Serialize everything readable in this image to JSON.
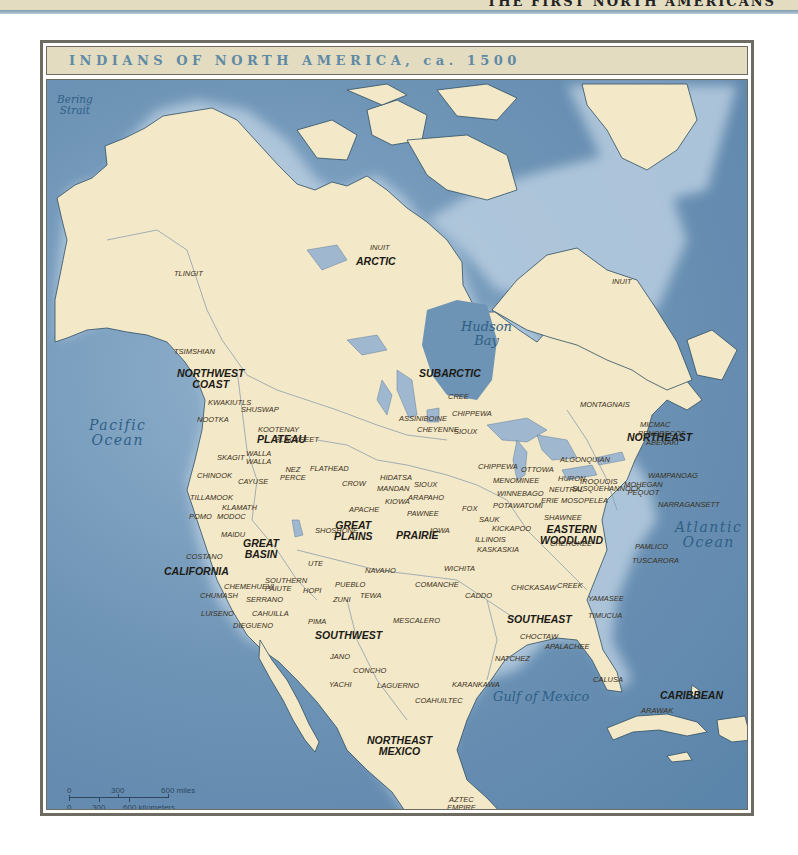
{
  "page": {
    "running_head": "THE FIRST NORTH AMERICANS"
  },
  "map": {
    "title": "INDIANS OF NORTH AMERICA, ca. 1500",
    "colors": {
      "ocean": "#6d93b5",
      "land": "#f3e8c8",
      "coast": "#2f4f63",
      "lake": "#9fb8d0",
      "title_bar": "#e4dcc0",
      "title_text": "#5f8aa6",
      "frame": "#6e6b62"
    },
    "water_bodies": [
      {
        "id": "bering-strait",
        "label": "Bering\nStrait"
      },
      {
        "id": "hudson-bay",
        "label": "Hudson\nBay"
      },
      {
        "id": "pacific-ocean",
        "label": "Pacific\nOcean"
      },
      {
        "id": "atlantic-ocean",
        "label": "Atlantic\nOcean"
      },
      {
        "id": "gulf-of-mexico",
        "label": "Gulf of Mexico"
      }
    ],
    "culture_regions": [
      {
        "id": "arctic",
        "label": "ARCTIC"
      },
      {
        "id": "subarctic",
        "label": "SUBARCTIC"
      },
      {
        "id": "northwest-coast",
        "label": "NORTHWEST\nCOAST"
      },
      {
        "id": "plateau",
        "label": "PLATEAU"
      },
      {
        "id": "california",
        "label": "CALIFORNIA"
      },
      {
        "id": "great-basin",
        "label": "GREAT\nBASIN"
      },
      {
        "id": "great-plains",
        "label": "GREAT\nPLAINS"
      },
      {
        "id": "prairie",
        "label": "PRAIRIE"
      },
      {
        "id": "southwest",
        "label": "SOUTHWEST"
      },
      {
        "id": "northeast",
        "label": "NORTHEAST"
      },
      {
        "id": "eastern-woodland",
        "label": "EASTERN\nWOODLAND"
      },
      {
        "id": "southeast",
        "label": "SOUTHEAST"
      },
      {
        "id": "northeast-mexico",
        "label": "NORTHEAST\nMEXICO"
      },
      {
        "id": "caribbean",
        "label": "CARIBBEAN"
      }
    ],
    "peoples": [
      "INUIT",
      "INUIT",
      "TLINGIT",
      "TSIMSHIAN",
      "KWAKIUTLS",
      "NOOTKA",
      "SHUSWAP",
      "KOOTENAY",
      "BLACKFEET",
      "SKAGIT",
      "WALLA\nWALLA",
      "CHINOOK",
      "NEZ\nPERCE",
      "CAYUSE",
      "FLATHEAD",
      "TILLAMOOK",
      "KLAMATH",
      "POMO",
      "MODOC",
      "MAIDU",
      "COSTANO",
      "CHEMEHUEVI",
      "CHUMASH",
      "SOUTHERN\nPAIUTE",
      "SERRANO",
      "LUISENO",
      "CAHUILLA",
      "DIEGUENO",
      "HOPI",
      "UTE",
      "SHOSHONE",
      "CROW",
      "HIDATSA",
      "MANDAN",
      "SIOUX",
      "ARAPAHO",
      "KIOWA",
      "APACHE",
      "PAWNEE",
      "IOWA",
      "CREE",
      "ASSINIBOINE",
      "CHIPPEWA",
      "CHEYENNE",
      "SIOUX",
      "CHIPPEWA",
      "OTTOWA",
      "MENOMINEE",
      "WINNEBAGO",
      "POTAWATOMI",
      "FOX",
      "SAUK",
      "KICKAPOO",
      "ILLINOIS",
      "KASKASKIA",
      "HURON",
      "NEUTRAL",
      "IROQUOIS",
      "ERIE",
      "MOSOPELEA",
      "SUSQUEHANNOCK",
      "SHAWNEE",
      "CHEROKEE",
      "MONTAGNAIS",
      "MICMAC",
      "PENOBSCOT",
      "ABENAKI",
      "ALGONQUIAN",
      "WAMPANOAG",
      "MOHEGAN\nPEQUOT",
      "NARRAGANSETT",
      "PAMLICO",
      "TUSCARORA",
      "NAVAHO",
      "PUEBLO",
      "ZUNI",
      "TEWA",
      "PIMA",
      "MESCALERO",
      "COMANCHE",
      "WICHITA",
      "CADDO",
      "CHICKASAW",
      "CREEK",
      "YAMASEE",
      "TIMUCUA",
      "CHOCTAW",
      "APALACHEE",
      "NATCHEZ",
      "JANO",
      "CONCHO",
      "YACHI",
      "LAGUERNO",
      "KARANKAWA",
      "COAHUILTEC",
      "CALUSA",
      "ARAWAK",
      "AZTEC\nEMPIRE"
    ],
    "scale_bar": {
      "miles": [
        "0",
        "300",
        "600 miles"
      ],
      "kilometers": [
        "0",
        "300",
        "600 kilometers"
      ]
    }
  }
}
